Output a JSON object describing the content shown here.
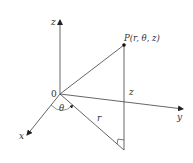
{
  "diagram": {
    "point_label": "P(r, θ, z)",
    "origin_label": "0",
    "axes": {
      "x": "x",
      "y": "y",
      "z": "z"
    },
    "segment_labels": {
      "r": "r",
      "height": "z",
      "angle": "θ"
    },
    "colors": {
      "line": "#555555",
      "text": "#333333",
      "background": "#ffffff"
    }
  }
}
